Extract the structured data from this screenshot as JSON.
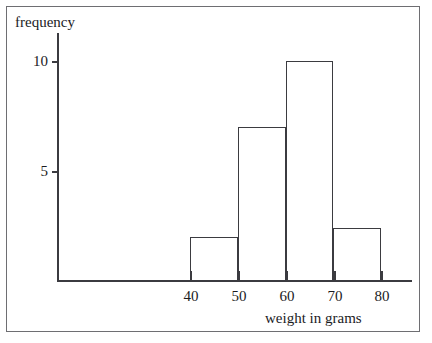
{
  "chart_data": {
    "type": "bar",
    "title": "",
    "xlabel": "weight in grams",
    "ylabel": "frequency",
    "bin_edges": [
      40,
      50,
      60,
      70,
      80
    ],
    "categories": [
      "40-50",
      "50-60",
      "60-70",
      "70-80"
    ],
    "values": [
      2,
      7,
      10,
      2.4
    ],
    "xtick_labels": [
      "40",
      "50",
      "60",
      "70",
      "80"
    ],
    "xticks": [
      40,
      50,
      60,
      70,
      80
    ],
    "ytick_labels": [
      "5",
      "10"
    ],
    "yticks": [
      5,
      10
    ],
    "xlim": [
      40,
      80
    ],
    "ylim": [
      0,
      11.5
    ],
    "grid": false,
    "legend": false,
    "bar_fill": "none",
    "bar_edge_color": "#3b3b40",
    "axis_color": "#3b3b40",
    "text_color": "#1b1b1e",
    "frame_color": "#6e6e72",
    "background": "#ffffff"
  }
}
